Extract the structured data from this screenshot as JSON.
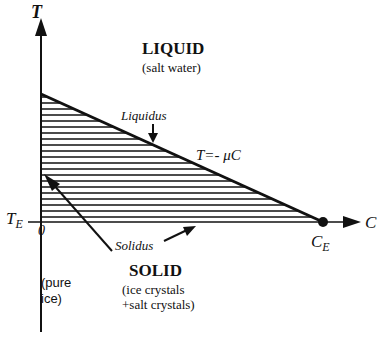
{
  "diagram": {
    "type": "phase-diagram",
    "axes": {
      "y_label": "T",
      "x_label": "C",
      "origin_label": "0",
      "eutectic_temperature_label": "T",
      "eutectic_temperature_subscript": "E",
      "eutectic_concentration_label": "C",
      "eutectic_concentration_subscript": "E"
    },
    "regions": {
      "liquid": {
        "title": "LIQUID",
        "subtitle": "(salt water)"
      },
      "solid": {
        "title": "SOLID",
        "subtitle_line1": "(ice crystals",
        "subtitle_line2": "+salt crystals)"
      },
      "pure_ice": {
        "line1": "(pure",
        "line2": "ice)"
      }
    },
    "curves": {
      "liquidus": {
        "label": "Liquidus",
        "equation": "T=- μC"
      },
      "solidus": {
        "label": "Solidus"
      }
    },
    "colors": {
      "ink": "#111111",
      "background": "#ffffff"
    }
  }
}
